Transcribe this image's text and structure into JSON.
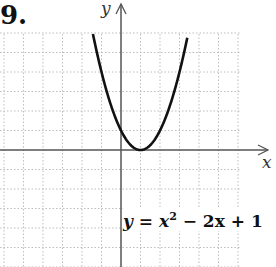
{
  "problem_number": "9.",
  "axes": {
    "x_label": "x",
    "y_label": "y"
  },
  "equation": {
    "lhs": "y",
    "eq": " = ",
    "x": "x",
    "exp": "2",
    "rest": " − 2x + 1"
  },
  "colors": {
    "grid": "#bdbdbd",
    "axis": "#555555",
    "curve": "#111111"
  },
  "chart_data": {
    "type": "line",
    "title": "",
    "function": "y = x^2 - 2x + 1",
    "xlabel": "x",
    "ylabel": "y",
    "xlim": [
      -6,
      6
    ],
    "ylim": [
      -6,
      6
    ],
    "grid": true,
    "vertex": [
      1,
      0
    ],
    "points": [
      {
        "x": -1.4,
        "y": 5.76
      },
      {
        "x": -1,
        "y": 4
      },
      {
        "x": 0,
        "y": 1
      },
      {
        "x": 1,
        "y": 0
      },
      {
        "x": 2,
        "y": 1
      },
      {
        "x": 3,
        "y": 4
      },
      {
        "x": 3.4,
        "y": 5.76
      }
    ],
    "annotations": [
      "y = x^2 - 2x + 1"
    ]
  }
}
